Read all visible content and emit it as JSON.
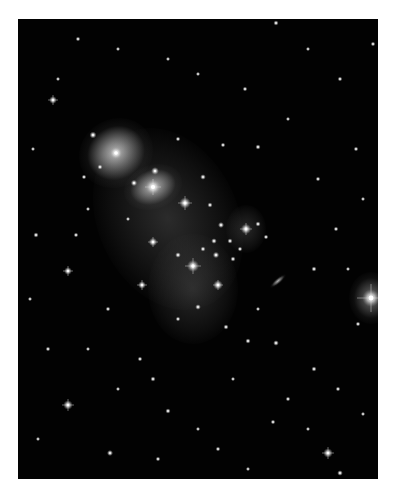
{
  "image": {
    "subject": "galaxy cluster deep field",
    "background": "#020202",
    "border": "#ffffff",
    "frame": {
      "x": 18,
      "y": 19,
      "w": 360,
      "h": 460
    }
  },
  "glows": [
    {
      "name": "bcg-upper-left",
      "x": 98,
      "y": 134,
      "rx": 38,
      "ry": 34,
      "color": "rgba(230,230,230,0.85)",
      "rot": -30
    },
    {
      "name": "bcg-main",
      "x": 135,
      "y": 168,
      "rx": 30,
      "ry": 22,
      "color": "rgba(240,240,240,0.85)",
      "rot": -20
    },
    {
      "name": "halo-plume",
      "x": 150,
      "y": 200,
      "rx": 70,
      "ry": 95,
      "color": "rgba(120,120,120,0.35)",
      "rot": -25
    },
    {
      "name": "tidal-stream-lower",
      "x": 175,
      "y": 270,
      "rx": 45,
      "ry": 55,
      "color": "rgba(110,110,110,0.35)",
      "rot": 0
    },
    {
      "name": "right-group",
      "x": 228,
      "y": 210,
      "rx": 20,
      "ry": 24,
      "color": "rgba(110,110,110,0.35)",
      "rot": 0
    },
    {
      "name": "bright-star-halo",
      "x": 353,
      "y": 279,
      "rx": 22,
      "ry": 26,
      "color": "rgba(200,200,200,0.55)",
      "rot": 0
    },
    {
      "name": "edge-on-galaxy",
      "x": 260,
      "y": 262,
      "rx": 10,
      "ry": 3,
      "color": "rgba(220,220,220,0.8)",
      "rot": -40
    }
  ],
  "stars": [
    {
      "x": 353,
      "y": 279,
      "r": 4,
      "spike": 14
    },
    {
      "x": 135,
      "y": 168,
      "r": 3.5,
      "spike": 8
    },
    {
      "x": 98,
      "y": 134,
      "r": 3,
      "spike": 0
    },
    {
      "x": 167,
      "y": 184,
      "r": 2.6,
      "spike": 7
    },
    {
      "x": 175,
      "y": 247,
      "r": 2.8,
      "spike": 8
    },
    {
      "x": 200,
      "y": 266,
      "r": 2.2,
      "spike": 5
    },
    {
      "x": 228,
      "y": 210,
      "r": 2.4,
      "spike": 6
    },
    {
      "x": 135,
      "y": 223,
      "r": 2,
      "spike": 5
    },
    {
      "x": 50,
      "y": 252,
      "r": 1.8,
      "spike": 5
    },
    {
      "x": 35,
      "y": 81,
      "r": 1.8,
      "spike": 5
    },
    {
      "x": 50,
      "y": 386,
      "r": 2.2,
      "spike": 6
    },
    {
      "x": 310,
      "y": 434,
      "r": 2.2,
      "spike": 6
    },
    {
      "x": 124,
      "y": 266,
      "r": 1.8,
      "spike": 5
    },
    {
      "x": 75,
      "y": 116,
      "r": 1.6,
      "spike": 0
    },
    {
      "x": 137,
      "y": 152,
      "r": 1.8,
      "spike": 0
    },
    {
      "x": 116,
      "y": 164,
      "r": 1.5,
      "spike": 0
    },
    {
      "x": 185,
      "y": 158,
      "r": 1.3,
      "spike": 0
    },
    {
      "x": 192,
      "y": 186,
      "r": 1.2,
      "spike": 0
    },
    {
      "x": 203,
      "y": 206,
      "r": 1.4,
      "spike": 0
    },
    {
      "x": 196,
      "y": 222,
      "r": 1.3,
      "spike": 0
    },
    {
      "x": 212,
      "y": 222,
      "r": 1.2,
      "spike": 0
    },
    {
      "x": 198,
      "y": 236,
      "r": 1.5,
      "spike": 0
    },
    {
      "x": 215,
      "y": 240,
      "r": 1.2,
      "spike": 0
    },
    {
      "x": 185,
      "y": 230,
      "r": 1.2,
      "spike": 0
    },
    {
      "x": 160,
      "y": 236,
      "r": 1.3,
      "spike": 0
    },
    {
      "x": 240,
      "y": 205,
      "r": 1.2,
      "spike": 0
    },
    {
      "x": 248,
      "y": 218,
      "r": 1.1,
      "spike": 0
    },
    {
      "x": 222,
      "y": 230,
      "r": 1.1,
      "spike": 0
    },
    {
      "x": 180,
      "y": 288,
      "r": 1.3,
      "spike": 0
    },
    {
      "x": 208,
      "y": 308,
      "r": 1.2,
      "spike": 0
    },
    {
      "x": 160,
      "y": 300,
      "r": 1.1,
      "spike": 0
    },
    {
      "x": 230,
      "y": 322,
      "r": 1.2,
      "spike": 0
    },
    {
      "x": 258,
      "y": 324,
      "r": 1.3,
      "spike": 0
    },
    {
      "x": 18,
      "y": 216,
      "r": 1.2,
      "spike": 0
    },
    {
      "x": 30,
      "y": 330,
      "r": 1.1,
      "spike": 0
    },
    {
      "x": 82,
      "y": 148,
      "r": 1.2,
      "spike": 0
    },
    {
      "x": 66,
      "y": 158,
      "r": 1.1,
      "spike": 0
    },
    {
      "x": 58,
      "y": 216,
      "r": 1.1,
      "spike": 0
    },
    {
      "x": 90,
      "y": 290,
      "r": 1.1,
      "spike": 0
    },
    {
      "x": 122,
      "y": 340,
      "r": 1.1,
      "spike": 0
    },
    {
      "x": 135,
      "y": 360,
      "r": 1.2,
      "spike": 0
    },
    {
      "x": 150,
      "y": 392,
      "r": 1.2,
      "spike": 0
    },
    {
      "x": 92,
      "y": 434,
      "r": 1.4,
      "spike": 0
    },
    {
      "x": 140,
      "y": 440,
      "r": 1.1,
      "spike": 0
    },
    {
      "x": 200,
      "y": 430,
      "r": 1.1,
      "spike": 0
    },
    {
      "x": 255,
      "y": 403,
      "r": 1.1,
      "spike": 0
    },
    {
      "x": 270,
      "y": 380,
      "r": 1.1,
      "spike": 0
    },
    {
      "x": 296,
      "y": 350,
      "r": 1.2,
      "spike": 0
    },
    {
      "x": 320,
      "y": 370,
      "r": 1.1,
      "spike": 0
    },
    {
      "x": 322,
      "y": 454,
      "r": 1.3,
      "spike": 0
    },
    {
      "x": 340,
      "y": 305,
      "r": 1.1,
      "spike": 0
    },
    {
      "x": 296,
      "y": 250,
      "r": 1.2,
      "spike": 0
    },
    {
      "x": 318,
      "y": 210,
      "r": 1.1,
      "spike": 0
    },
    {
      "x": 300,
      "y": 160,
      "r": 1.1,
      "spike": 0
    },
    {
      "x": 338,
      "y": 130,
      "r": 1.1,
      "spike": 0
    },
    {
      "x": 322,
      "y": 60,
      "r": 1.1,
      "spike": 0
    },
    {
      "x": 355,
      "y": 25,
      "r": 1.1,
      "spike": 0
    },
    {
      "x": 258,
      "y": 4,
      "r": 1.2,
      "spike": 0
    },
    {
      "x": 227,
      "y": 70,
      "r": 1.1,
      "spike": 0
    },
    {
      "x": 240,
      "y": 128,
      "r": 1.2,
      "spike": 0
    },
    {
      "x": 205,
      "y": 126,
      "r": 1.1,
      "spike": 0
    },
    {
      "x": 160,
      "y": 120,
      "r": 1.1,
      "spike": 0
    },
    {
      "x": 60,
      "y": 20,
      "r": 1.1,
      "spike": 0
    },
    {
      "x": 100,
      "y": 30,
      "r": 1,
      "spike": 0
    },
    {
      "x": 150,
      "y": 40,
      "r": 1,
      "spike": 0
    },
    {
      "x": 180,
      "y": 55,
      "r": 1,
      "spike": 0
    },
    {
      "x": 40,
      "y": 60,
      "r": 1,
      "spike": 0
    },
    {
      "x": 15,
      "y": 130,
      "r": 1,
      "spike": 0
    },
    {
      "x": 270,
      "y": 100,
      "r": 1,
      "spike": 0
    },
    {
      "x": 290,
      "y": 30,
      "r": 1,
      "spike": 0
    },
    {
      "x": 345,
      "y": 180,
      "r": 1,
      "spike": 0
    },
    {
      "x": 330,
      "y": 250,
      "r": 1,
      "spike": 0
    },
    {
      "x": 12,
      "y": 280,
      "r": 1,
      "spike": 0
    },
    {
      "x": 70,
      "y": 330,
      "r": 1,
      "spike": 0
    },
    {
      "x": 100,
      "y": 370,
      "r": 1,
      "spike": 0
    },
    {
      "x": 20,
      "y": 420,
      "r": 1,
      "spike": 0
    },
    {
      "x": 180,
      "y": 410,
      "r": 1,
      "spike": 0
    },
    {
      "x": 230,
      "y": 450,
      "r": 1,
      "spike": 0
    },
    {
      "x": 290,
      "y": 410,
      "r": 1,
      "spike": 0
    },
    {
      "x": 345,
      "y": 395,
      "r": 1,
      "spike": 0
    },
    {
      "x": 215,
      "y": 360,
      "r": 1,
      "spike": 0
    },
    {
      "x": 240,
      "y": 290,
      "r": 1,
      "spike": 0
    },
    {
      "x": 110,
      "y": 200,
      "r": 1,
      "spike": 0
    },
    {
      "x": 70,
      "y": 190,
      "r": 1,
      "spike": 0
    }
  ]
}
